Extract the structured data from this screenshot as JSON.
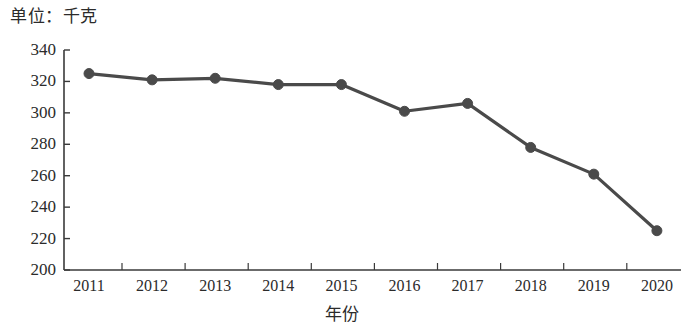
{
  "chart_data": {
    "type": "line",
    "title": "单位：千克",
    "subtitle": "",
    "xlabel": "年份",
    "ylabel": "",
    "categories": [
      "2011",
      "2012",
      "2013",
      "2014",
      "2015",
      "2016",
      "2017",
      "2018",
      "2019",
      "2020"
    ],
    "values": [
      325,
      321,
      322,
      318,
      318,
      301,
      306,
      278,
      261,
      225
    ],
    "series": [
      {
        "name": "",
        "values": [
          325,
          321,
          322,
          318,
          318,
          301,
          306,
          278,
          261,
          225
        ]
      }
    ],
    "ylim": [
      200,
      340
    ],
    "ytick_step": 20,
    "ytick_labels": [
      "200",
      "220",
      "240",
      "260",
      "280",
      "300",
      "320",
      "340"
    ],
    "grid": false,
    "legend": "none",
    "line_color": "#4a4a4a",
    "marker": "circle",
    "marker_color": "#4a4a4a",
    "axis_color": "#3a3a3a"
  },
  "axis": {
    "y_top_value": 340,
    "y_bottom_value": 200
  }
}
